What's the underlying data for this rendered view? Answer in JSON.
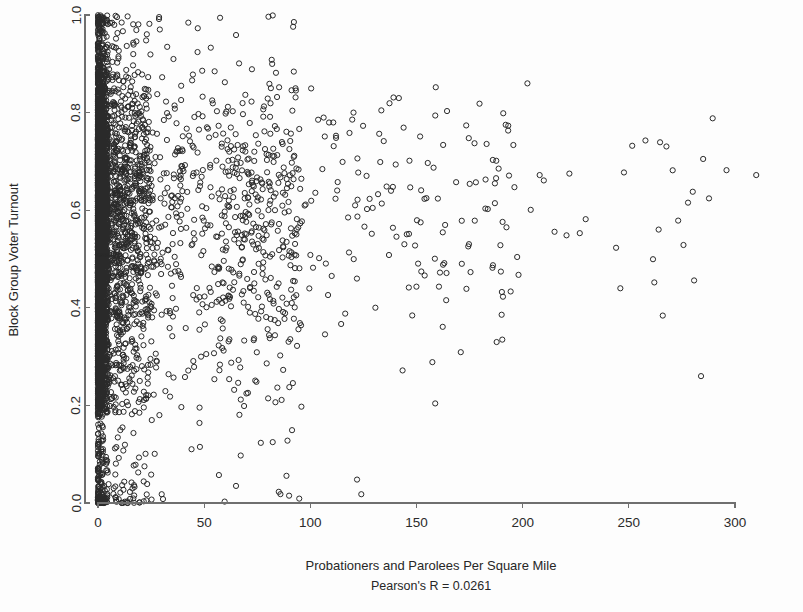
{
  "figure": {
    "width": 803,
    "height": 612,
    "background_color": "#fdfdfd",
    "marker_color": "#2a2a2a",
    "axis_color": "#6f6f6f",
    "text_color": "#272727"
  },
  "chart_data": {
    "type": "scatter",
    "title": "",
    "xlabel": "Probationers and Parolees Per Square Mile",
    "ylabel": "Block Group Voter Turnout",
    "annotation": "Pearson's R = 0.0261",
    "pearson_r": 0.0261,
    "grid": false,
    "legend": null,
    "xlim": [
      0,
      300
    ],
    "ylim": [
      0.0,
      1.0
    ],
    "xticks": [
      0,
      50,
      100,
      150,
      200,
      250,
      300
    ],
    "xticklabels": [
      "0",
      "50",
      "100",
      "150",
      "200",
      "250",
      "300"
    ],
    "yticks": [
      0.0,
      0.2,
      0.4,
      0.6,
      0.8,
      1.0
    ],
    "yticklabels": [
      "0.0",
      "0.2",
      "0.4",
      "0.6",
      "0.8",
      "1.0"
    ],
    "marker": "open-circle",
    "marker_radius_px": 2.6,
    "n_points": 5200,
    "x_distribution": "exponential-decay, heavy mass near 0, long right tail to ~310",
    "y_distribution": "broad 0.0-1.0, mode near 0.55-0.70, dense column at x<3",
    "sparse_outliers": [
      {
        "x": 30,
        "y": 0.018
      },
      {
        "x": 48,
        "y": 0.115
      },
      {
        "x": 65,
        "y": 0.035
      },
      {
        "x": 90,
        "y": 0.015
      },
      {
        "x": 122,
        "y": 0.048
      },
      {
        "x": 124,
        "y": 0.018
      },
      {
        "x": 192,
        "y": 0.775
      },
      {
        "x": 208,
        "y": 0.672
      },
      {
        "x": 222,
        "y": 0.675
      },
      {
        "x": 244,
        "y": 0.523
      },
      {
        "x": 246,
        "y": 0.44
      },
      {
        "x": 262,
        "y": 0.452
      },
      {
        "x": 284,
        "y": 0.26
      },
      {
        "x": 285,
        "y": 0.705
      },
      {
        "x": 296,
        "y": 0.682
      },
      {
        "x": 310,
        "y": 0.672
      }
    ]
  },
  "axes": {
    "x_axis_name": "x-axis",
    "y_axis_name": "y-axis",
    "plot_left_px": 98,
    "plot_right_px": 735,
    "plot_top_px": 15,
    "plot_bottom_px": 503
  }
}
